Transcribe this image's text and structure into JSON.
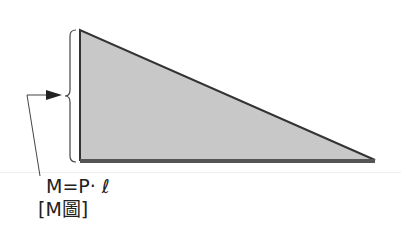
{
  "diagram": {
    "formula": "M=P· ℓ",
    "caption": "[M圖]",
    "colors": {
      "fill": "#c8c8c8",
      "stroke": "#333333",
      "base": "#555555"
    }
  }
}
